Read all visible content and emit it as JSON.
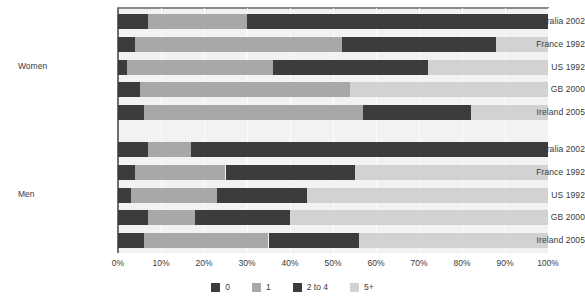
{
  "chart_data": {
    "type": "bar",
    "orientation": "horizontal",
    "stacked": true,
    "stacked_percent": true,
    "title": "",
    "xlabel": "",
    "ylabel": "",
    "xlim": [
      0,
      100
    ],
    "grid": true,
    "legend_position": "bottom",
    "x_ticks": [
      "0%",
      "10%",
      "20%",
      "30%",
      "40%",
      "50%",
      "60%",
      "70%",
      "80%",
      "90%",
      "100%"
    ],
    "x_tick_values": [
      0,
      10,
      20,
      30,
      40,
      50,
      60,
      70,
      80,
      90,
      100
    ],
    "series": [
      {
        "name": "0",
        "color": "#3c3c3c"
      },
      {
        "name": "1",
        "color": "#a8a8a8"
      },
      {
        "name": "2 to 4",
        "color": "#3c3c3c"
      },
      {
        "name": "5+",
        "color": "#d2d2d2"
      }
    ],
    "groups": [
      {
        "label": "Women",
        "categories": [
          "Australia 2002",
          "France 1992",
          "US 1992",
          "GB 2000",
          "Ireland 2005"
        ],
        "values": [
          [
            7,
            23,
            70,
            0
          ],
          [
            4,
            48,
            36,
            12
          ],
          [
            2,
            34,
            36,
            28
          ],
          [
            5,
            49,
            0,
            46
          ],
          [
            6,
            51,
            25,
            18
          ]
        ]
      },
      {
        "label": "Men",
        "categories": [
          "Australia 2002",
          "France 1992",
          "US 1992",
          "GB 2000",
          "Ireland 2005"
        ],
        "values": [
          [
            7,
            10,
            83,
            0
          ],
          [
            4,
            21,
            30,
            45
          ],
          [
            3,
            20,
            21,
            56
          ],
          [
            7,
            11,
            22,
            60
          ],
          [
            6,
            29,
            21,
            44
          ]
        ]
      }
    ]
  },
  "legend": {
    "items": [
      {
        "label": "0",
        "color": "#3c3c3c"
      },
      {
        "label": "1",
        "color": "#a8a8a8"
      },
      {
        "label": "2 to 4",
        "color": "#3c3c3c"
      },
      {
        "label": "5+",
        "color": "#d2d2d2"
      }
    ]
  },
  "colors": {
    "plot_background": "#f2f2f2",
    "gridline": "#ffffff",
    "axis": "#6e6e6e",
    "text": "#3a3a3a"
  }
}
